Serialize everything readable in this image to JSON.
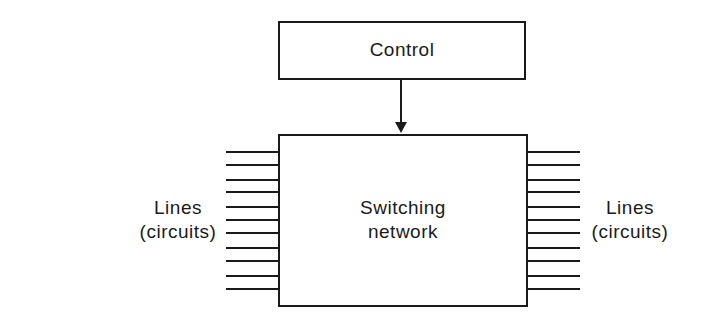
{
  "diagram": {
    "control_box": {
      "label": "Control"
    },
    "switching_box": {
      "label_line1": "Switching",
      "label_line2": "network"
    },
    "left_lines": {
      "label_line1": "Lines",
      "label_line2": "(circuits)",
      "count": 11
    },
    "right_lines": {
      "label_line1": "Lines",
      "label_line2": "(circuits)",
      "count": 11
    },
    "arrow": {
      "from": "Control",
      "to": "Switching network"
    },
    "colors": {
      "stroke": "#1a1a1a",
      "background": "#ffffff"
    }
  }
}
